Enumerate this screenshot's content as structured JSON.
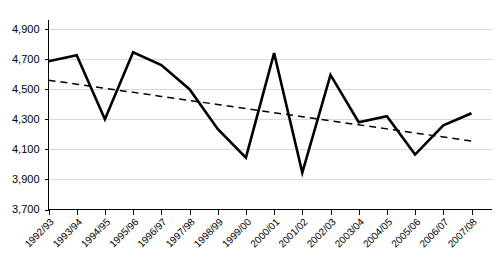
{
  "chart_data": {
    "type": "line",
    "title": "",
    "subtitle": "",
    "xlabel": "",
    "ylabel": "",
    "ylim": [
      3700,
      4900
    ],
    "ytick_values": [
      4900,
      4700,
      4500,
      4300,
      4100,
      3900,
      3700
    ],
    "ytick_labels": [
      "4,900",
      "4,700",
      "4,500",
      "4,300",
      "4,100",
      "3,900",
      "3,700"
    ],
    "grid": true,
    "grid_axis": "y",
    "legend": "none",
    "categories": [
      "1992/93",
      "1993/94",
      "1994/95",
      "1995/96",
      "1996/97",
      "1997/98",
      "1998/99",
      "1999/00",
      "2000/01",
      "2001/02",
      "2002/03",
      "2003/04",
      "2004/05",
      "2005/06",
      "2006/07",
      "2007/08"
    ],
    "series": [
      {
        "name": "Series",
        "style": "solid",
        "color": "#000000",
        "values": [
          4685,
          4725,
          4300,
          4745,
          4660,
          4500,
          4235,
          4045,
          4740,
          3945,
          4595,
          4280,
          4320,
          4065,
          4260,
          4340
        ]
      },
      {
        "name": "Linear trend",
        "style": "dashed",
        "color": "#000000",
        "values": [
          4560,
          4533,
          4506,
          4479,
          4452,
          4425,
          4398,
          4371,
          4344,
          4317,
          4290,
          4263,
          4236,
          4209,
          4182,
          4155
        ]
      }
    ]
  },
  "axes": {
    "y_axis_name": "value-axis",
    "x_axis_name": "category-axis"
  }
}
